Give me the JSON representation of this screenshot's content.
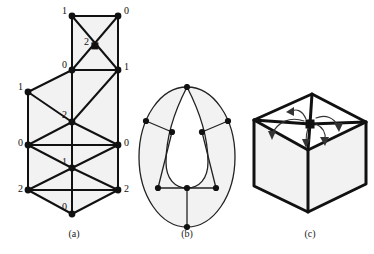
{
  "figure": {
    "background_color": "#ffffff",
    "line_color": "#111111",
    "face_fill_color": "#f2f2f2",
    "captions": [
      {
        "id": "a",
        "label": "(a)"
      },
      {
        "id": "b",
        "label": "(b)"
      },
      {
        "id": "c",
        "label": "(c)"
      }
    ]
  },
  "panel_a": {
    "name": "triangulated-strip-with-vertex-labels",
    "vertex_labels": [
      {
        "id": "v-top-left",
        "label": "1",
        "x": 72,
        "y": 16,
        "marker": "disc",
        "label_x": 62,
        "label_y": 14
      },
      {
        "id": "v-top-right",
        "label": "0",
        "x": 118,
        "y": 16,
        "marker": "disc",
        "label_x": 124,
        "label_y": 14
      },
      {
        "id": "v-center-square",
        "label": "2",
        "x": 95,
        "y": 46,
        "marker": "square",
        "label_x": 84,
        "label_y": 45
      },
      {
        "id": "v-mid-left",
        "label": "0",
        "x": 72,
        "y": 70,
        "marker": "disc",
        "label_x": 62,
        "label_y": 68
      },
      {
        "id": "v-mid-right",
        "label": "1",
        "x": 118,
        "y": 70,
        "marker": "disc",
        "label_x": 124,
        "label_y": 70
      },
      {
        "id": "v-left-upper",
        "label": "1",
        "x": 28,
        "y": 92,
        "marker": "disc",
        "label_x": 18,
        "label_y": 90
      },
      {
        "id": "v-core-upper",
        "label": "2",
        "x": 72,
        "y": 122,
        "marker": "disc",
        "label_x": 62,
        "label_y": 118
      },
      {
        "id": "v-left-mid",
        "label": "0",
        "x": 28,
        "y": 145,
        "marker": "disc",
        "label_x": 18,
        "label_y": 146
      },
      {
        "id": "v-right-mid",
        "label": "0",
        "x": 118,
        "y": 145,
        "marker": "disc",
        "label_x": 124,
        "label_y": 146
      },
      {
        "id": "v-core-lower",
        "label": "1",
        "x": 72,
        "y": 168,
        "marker": "disc",
        "label_x": 62,
        "label_y": 165
      },
      {
        "id": "v-left-lower",
        "label": "2",
        "x": 28,
        "y": 190,
        "marker": "disc",
        "label_x": 18,
        "label_y": 192
      },
      {
        "id": "v-right-lower",
        "label": "2",
        "x": 118,
        "y": 190,
        "marker": "disc",
        "label_x": 124,
        "label_y": 192
      },
      {
        "id": "v-bottom",
        "label": "0",
        "x": 72,
        "y": 214,
        "marker": "disc",
        "label_x": 62,
        "label_y": 210
      }
    ]
  },
  "panel_b": {
    "name": "oval-embedded-graph",
    "vertex_count": 8,
    "description": "oval outline with inner teardrop region, eight degree-labeled-free vertices"
  },
  "panel_c": {
    "name": "cube-with-vertex-rotation-arrows",
    "arrow_count": 4,
    "description": "isometric cube, top face triangulated from a central square vertex, four curved arrows radiating from that vertex"
  }
}
